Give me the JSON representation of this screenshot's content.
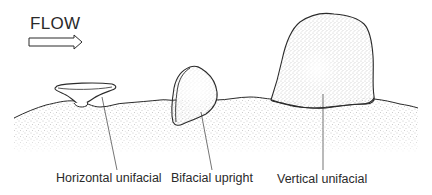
{
  "flow": {
    "label": "FLOW",
    "direction": "right"
  },
  "labels": {
    "horizontal": "Horizontal unifacial",
    "bifacial": "Bifacial upright",
    "vertical": "Vertical unifacial"
  },
  "colors": {
    "stroke": "#2b2b2b",
    "text": "#2a2a2a",
    "stipple": "#8a8a8a",
    "background": "#ffffff"
  }
}
